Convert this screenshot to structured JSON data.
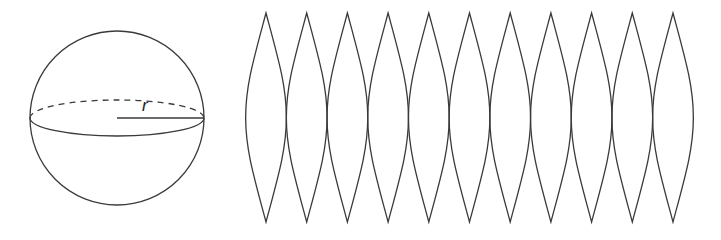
{
  "figure": {
    "sphere": {
      "center_x": 117,
      "center_y": 118,
      "radius": 87,
      "equator_ry": 18,
      "radius_label": "r"
    },
    "gores": {
      "count": 11,
      "first_tip_x": 266,
      "spacing": 40.7,
      "top_y": 13,
      "bottom_y": 222,
      "half_width": 20.35
    },
    "colors": {
      "stroke": "#3a3a3a",
      "background": "#ffffff"
    }
  }
}
